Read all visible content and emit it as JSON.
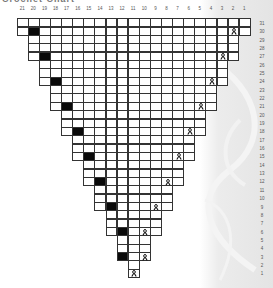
{
  "title": "Crochet Chart",
  "column_numbers": [
    "21",
    "20",
    "19",
    "18",
    "17",
    "16",
    "15",
    "14",
    "13",
    "12",
    "11",
    "10",
    "9",
    "8",
    "7",
    "6",
    "5",
    "4",
    "3",
    "2",
    "1"
  ],
  "row_numbers": [
    "31",
    "30",
    "29",
    "28",
    "27",
    "26",
    "25",
    "24",
    "23",
    "22",
    "21",
    "20",
    "19",
    "18",
    "17",
    "16",
    "15",
    "14",
    "13",
    "12",
    "11",
    "10",
    "9",
    "8",
    "7",
    "6",
    "5",
    "4",
    "3",
    "2",
    "1"
  ],
  "legend_symbols": {
    "black": "filled-square",
    "ribbon": "ribbon-icon"
  },
  "rows": [
    {
      "row": 31,
      "from": 21,
      "to": 1,
      "black": null,
      "ribbon": null
    },
    {
      "row": 30,
      "from": 21,
      "to": 1,
      "black": 20,
      "ribbon": 2
    },
    {
      "row": 29,
      "from": 20,
      "to": 2,
      "black": null,
      "ribbon": null
    },
    {
      "row": 28,
      "from": 20,
      "to": 2,
      "black": null,
      "ribbon": null
    },
    {
      "row": 27,
      "from": 20,
      "to": 2,
      "black": 19,
      "ribbon": 3
    },
    {
      "row": 26,
      "from": 19,
      "to": 3,
      "black": null,
      "ribbon": null
    },
    {
      "row": 25,
      "from": 19,
      "to": 3,
      "black": null,
      "ribbon": null
    },
    {
      "row": 24,
      "from": 19,
      "to": 3,
      "black": 18,
      "ribbon": 4
    },
    {
      "row": 23,
      "from": 18,
      "to": 4,
      "black": null,
      "ribbon": null
    },
    {
      "row": 22,
      "from": 18,
      "to": 4,
      "black": null,
      "ribbon": null
    },
    {
      "row": 21,
      "from": 18,
      "to": 4,
      "black": 17,
      "ribbon": 5
    },
    {
      "row": 20,
      "from": 17,
      "to": 5,
      "black": null,
      "ribbon": null
    },
    {
      "row": 19,
      "from": 17,
      "to": 5,
      "black": null,
      "ribbon": null
    },
    {
      "row": 18,
      "from": 17,
      "to": 5,
      "black": 16,
      "ribbon": 6
    },
    {
      "row": 17,
      "from": 16,
      "to": 6,
      "black": null,
      "ribbon": null
    },
    {
      "row": 16,
      "from": 16,
      "to": 6,
      "black": null,
      "ribbon": null
    },
    {
      "row": 15,
      "from": 16,
      "to": 6,
      "black": 15,
      "ribbon": 7
    },
    {
      "row": 14,
      "from": 15,
      "to": 7,
      "black": null,
      "ribbon": null
    },
    {
      "row": 13,
      "from": 15,
      "to": 7,
      "black": null,
      "ribbon": null
    },
    {
      "row": 12,
      "from": 15,
      "to": 7,
      "black": 14,
      "ribbon": 8
    },
    {
      "row": 11,
      "from": 14,
      "to": 8,
      "black": null,
      "ribbon": null
    },
    {
      "row": 10,
      "from": 14,
      "to": 8,
      "black": null,
      "ribbon": null
    },
    {
      "row": 9,
      "from": 14,
      "to": 8,
      "black": 13,
      "ribbon": 9
    },
    {
      "row": 8,
      "from": 13,
      "to": 9,
      "black": null,
      "ribbon": null
    },
    {
      "row": 7,
      "from": 13,
      "to": 9,
      "black": null,
      "ribbon": null
    },
    {
      "row": 6,
      "from": 13,
      "to": 9,
      "black": 12,
      "ribbon": 10
    },
    {
      "row": 5,
      "from": 12,
      "to": 10,
      "black": null,
      "ribbon": null
    },
    {
      "row": 4,
      "from": 12,
      "to": 10,
      "black": null,
      "ribbon": null
    },
    {
      "row": 3,
      "from": 12,
      "to": 10,
      "black": 12,
      "ribbon": 10
    },
    {
      "row": 2,
      "from": 11,
      "to": 11,
      "black": null,
      "ribbon": null
    },
    {
      "row": 1,
      "from": 11,
      "to": 11,
      "black": null,
      "ribbon": 11
    }
  ],
  "colors": {
    "grid_line": "#333333",
    "filled": "#0a0a0a",
    "panel": "#e6e6e6",
    "ribbon": "#111111"
  }
}
